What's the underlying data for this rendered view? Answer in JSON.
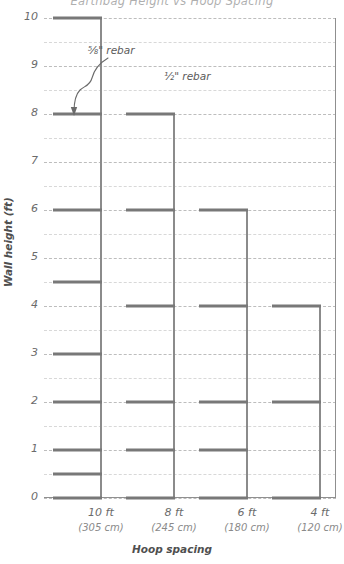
{
  "chart": {
    "title": "Earthbag Height vs Hoop Spacing",
    "y_title": "Wall height (ft)",
    "x_title": "Hoop spacing",
    "y_ticks": [
      "10",
      "9",
      "8",
      "7",
      "6",
      "5",
      "4",
      "3",
      "2",
      "1",
      "0"
    ],
    "x_categories": [
      {
        "label": "10 ft",
        "metric": "(305 cm)"
      },
      {
        "label": "8 ft",
        "metric": "(245 cm)"
      },
      {
        "label": "6 ft",
        "metric": "(180 cm)"
      },
      {
        "label": "4 ft",
        "metric": "(120 cm)"
      }
    ],
    "annotations": [
      {
        "text": "⅝\" rebar"
      },
      {
        "text": "½\" rebar"
      }
    ],
    "colors": {
      "bar": "#787878",
      "post": "#8b8b8b",
      "grid": "#bdbdbd",
      "frame": "#8f8f8f",
      "text": "#6b6b6b"
    }
  },
  "chart_data": {
    "type": "bar",
    "title": "Earthbag Height vs Hoop Spacing",
    "xlabel": "Hoop spacing",
    "ylabel": "Wall height (ft)",
    "ylim": [
      0,
      10
    ],
    "grid": true,
    "grid_major_step": 1,
    "grid_minor_step": 0.5,
    "orientation": "vertical-posts-with-horizontal-rebar",
    "legend": "none",
    "categories": [
      "10 ft",
      "8 ft",
      "6 ft",
      "4 ft"
    ],
    "category_metric": [
      "305 cm",
      "245 cm",
      "180 cm",
      "120 cm"
    ],
    "series": [
      {
        "name": "10 ft hoop spacing",
        "max_wall_height": 10,
        "rebar_size": "5/8 in",
        "rebar_heights": [
          0,
          0.5,
          1,
          2,
          3,
          4.5,
          6,
          8,
          10
        ]
      },
      {
        "name": "8 ft hoop spacing",
        "max_wall_height": 8,
        "rebar_size": "1/2 in",
        "rebar_heights": [
          0,
          1,
          2,
          4,
          6,
          8
        ]
      },
      {
        "name": "6 ft hoop spacing",
        "max_wall_height": 6,
        "rebar_size": "1/2 in",
        "rebar_heights": [
          0,
          1,
          2,
          4,
          6
        ]
      },
      {
        "name": "4 ft hoop spacing",
        "max_wall_height": 4,
        "rebar_size": "1/2 in",
        "rebar_heights": [
          0,
          2,
          4
        ]
      }
    ],
    "annotations": [
      {
        "text": "5/8\" rebar",
        "points_to": "10 ft hoop spacing"
      },
      {
        "text": "1/2\" rebar",
        "points_to": "8 ft hoop spacing"
      }
    ]
  }
}
